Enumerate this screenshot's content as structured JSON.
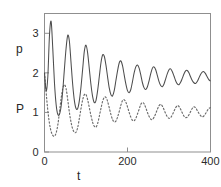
{
  "figure": {
    "background_color": "#ffffff",
    "frame_color": "#8f8f8f",
    "curve_p_color": "#4d4d4d",
    "curve_P_color": "#6b6b6b"
  },
  "labels": {
    "y_upper": "p",
    "y_lower": "P",
    "x_axis": "t"
  },
  "ticks": {
    "y": [
      "0",
      "1",
      "2",
      "3"
    ],
    "x": [
      "0",
      "200",
      "400"
    ]
  },
  "chart_data": {
    "type": "line",
    "title": "",
    "xlabel": "t",
    "ylabel": "",
    "xlim": [
      0,
      400
    ],
    "ylim": [
      0,
      3.5
    ],
    "xticks": [
      0,
      200,
      400
    ],
    "yticks": [
      0,
      1,
      2,
      3
    ],
    "grid": false,
    "legend_position": "none",
    "annotations": [
      {
        "text": "p",
        "meaning": "solid curve label",
        "x_px": 16,
        "y_px": 43
      },
      {
        "text": "P",
        "meaning": "dotted curve label",
        "x_px": 16,
        "y_px": 103
      }
    ],
    "series": [
      {
        "name": "p",
        "style": "solid",
        "color": "#4d4d4d",
        "description": "damped oscillation relaxing toward 1.9, initial spike to 3.3",
        "x": [
          0,
          4,
          8,
          12,
          16,
          20,
          24,
          28,
          32,
          36,
          40,
          44,
          48,
          52,
          56,
          60,
          64,
          68,
          72,
          76,
          80,
          84,
          88,
          92,
          96,
          100,
          104,
          108,
          112,
          116,
          120,
          124,
          128,
          132,
          136,
          140,
          144,
          148,
          152,
          156,
          160,
          164,
          168,
          172,
          176,
          180,
          184,
          188,
          192,
          196,
          200,
          204,
          208,
          212,
          216,
          220,
          224,
          228,
          232,
          236,
          240,
          244,
          248,
          252,
          256,
          260,
          264,
          268,
          272,
          276,
          280,
          284,
          288,
          292,
          296,
          300,
          304,
          308,
          312,
          316,
          320,
          324,
          328,
          332,
          336,
          340,
          344,
          348,
          352,
          356,
          360,
          364,
          368,
          372,
          376,
          380,
          384,
          388,
          392,
          396,
          400
        ],
        "y": [
          2.0,
          1.55,
          1.9,
          2.95,
          3.3,
          2.6,
          1.75,
          1.2,
          0.95,
          0.95,
          1.15,
          1.55,
          2.1,
          2.62,
          2.95,
          2.8,
          2.25,
          1.7,
          1.3,
          1.1,
          1.1,
          1.3,
          1.65,
          2.1,
          2.55,
          2.7,
          2.5,
          2.1,
          1.7,
          1.4,
          1.25,
          1.3,
          1.55,
          1.9,
          2.25,
          2.45,
          2.42,
          2.2,
          1.9,
          1.62,
          1.45,
          1.42,
          1.55,
          1.8,
          2.05,
          2.25,
          2.3,
          2.18,
          1.95,
          1.72,
          1.55,
          1.5,
          1.58,
          1.78,
          2.0,
          2.15,
          2.2,
          2.12,
          1.95,
          1.75,
          1.62,
          1.58,
          1.65,
          1.8,
          1.98,
          2.12,
          2.15,
          2.08,
          1.93,
          1.78,
          1.68,
          1.65,
          1.72,
          1.85,
          1.98,
          2.08,
          2.1,
          2.03,
          1.92,
          1.8,
          1.72,
          1.7,
          1.76,
          1.86,
          1.97,
          2.05,
          2.06,
          2.0,
          1.9,
          1.81,
          1.75,
          1.73,
          1.78,
          1.87,
          1.96,
          2.02,
          2.03,
          1.98,
          1.9,
          1.83,
          1.79
        ]
      },
      {
        "name": "P",
        "style": "dotted",
        "color": "#6b6b6b",
        "description": "damped oscillation relaxing toward 0.95, out of phase with p",
        "x": [
          0,
          4,
          8,
          12,
          16,
          20,
          24,
          28,
          32,
          36,
          40,
          44,
          48,
          52,
          56,
          60,
          64,
          68,
          72,
          76,
          80,
          84,
          88,
          92,
          96,
          100,
          104,
          108,
          112,
          116,
          120,
          124,
          128,
          132,
          136,
          140,
          144,
          148,
          152,
          156,
          160,
          164,
          168,
          172,
          176,
          180,
          184,
          188,
          192,
          196,
          200,
          204,
          208,
          212,
          216,
          220,
          224,
          228,
          232,
          236,
          240,
          244,
          248,
          252,
          256,
          260,
          264,
          268,
          272,
          276,
          280,
          284,
          288,
          292,
          296,
          300,
          304,
          308,
          312,
          316,
          320,
          324,
          328,
          332,
          336,
          340,
          344,
          348,
          352,
          356,
          360,
          364,
          368,
          372,
          376,
          380,
          384,
          388,
          392,
          396,
          400
        ],
        "y": [
          2.0,
          1.5,
          1.05,
          0.72,
          0.52,
          0.42,
          0.4,
          0.48,
          0.68,
          1.0,
          1.35,
          1.6,
          1.7,
          1.6,
          1.32,
          1.0,
          0.75,
          0.58,
          0.5,
          0.5,
          0.62,
          0.85,
          1.1,
          1.32,
          1.45,
          1.45,
          1.32,
          1.12,
          0.92,
          0.75,
          0.65,
          0.63,
          0.72,
          0.9,
          1.1,
          1.28,
          1.38,
          1.38,
          1.28,
          1.12,
          0.95,
          0.82,
          0.76,
          0.78,
          0.88,
          1.02,
          1.18,
          1.3,
          1.32,
          1.26,
          1.14,
          1.0,
          0.88,
          0.8,
          0.79,
          0.85,
          0.96,
          1.08,
          1.2,
          1.25,
          1.22,
          1.12,
          1.0,
          0.9,
          0.83,
          0.82,
          0.88,
          0.97,
          1.08,
          1.17,
          1.2,
          1.16,
          1.07,
          0.97,
          0.89,
          0.85,
          0.87,
          0.94,
          1.03,
          1.12,
          1.17,
          1.15,
          1.08,
          0.99,
          0.91,
          0.87,
          0.88,
          0.94,
          1.02,
          1.1,
          1.14,
          1.12,
          1.05,
          0.98,
          0.92,
          0.89,
          0.91,
          0.97,
          1.04,
          1.1,
          1.12
        ]
      }
    ]
  }
}
